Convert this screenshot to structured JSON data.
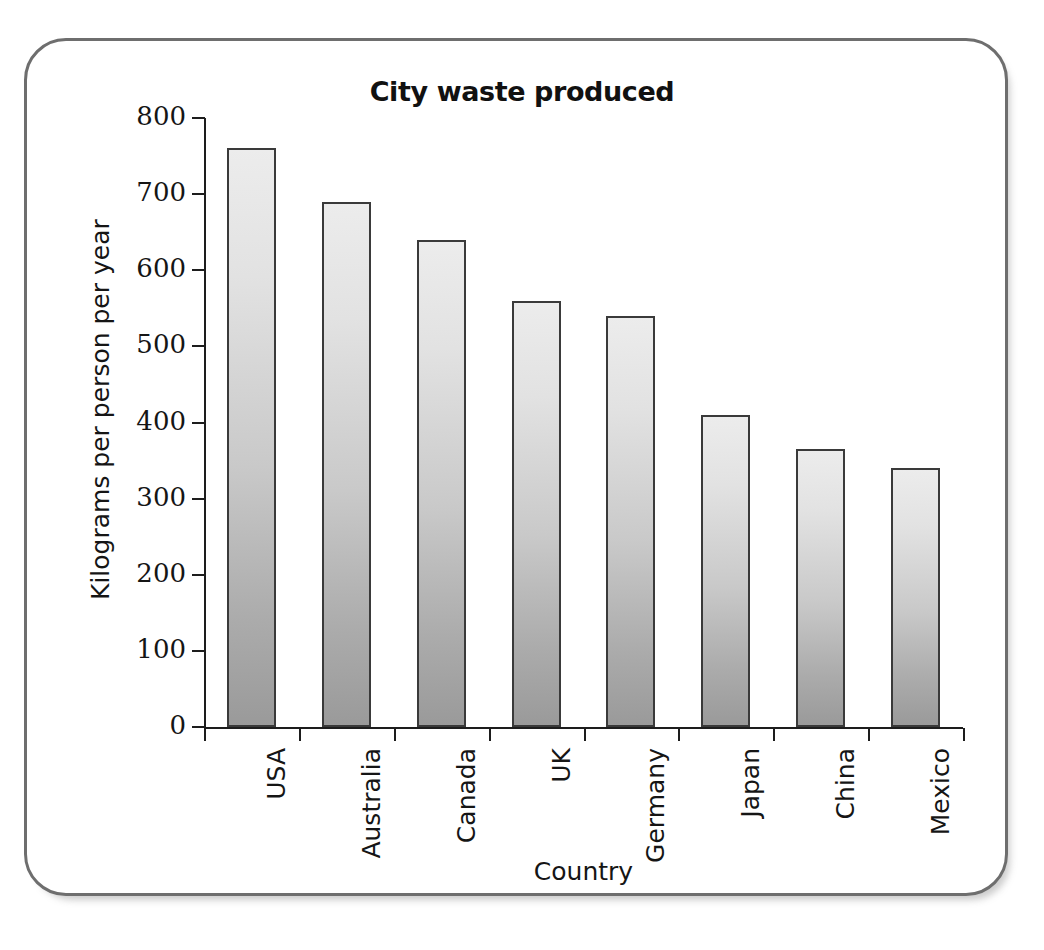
{
  "chart_data": {
    "type": "bar",
    "title": "City waste produced",
    "xlabel": "Country",
    "ylabel": "Kilograms per person per year",
    "categories": [
      "USA",
      "Australia",
      "Canada",
      "UK",
      "Germany",
      "Japan",
      "China",
      "Mexico"
    ],
    "values": [
      760,
      690,
      640,
      560,
      540,
      410,
      365,
      340
    ],
    "ylim": [
      0,
      800
    ],
    "ytick_labels": [
      "0",
      "100",
      "200",
      "300",
      "400",
      "500",
      "600",
      "700",
      "800"
    ],
    "ytick_values": [
      0,
      100,
      200,
      300,
      400,
      500,
      600,
      700,
      800
    ],
    "grid": false,
    "legend": "none",
    "bar_fill_top_color": "#ececec",
    "bar_fill_bottom_color": "#9a9a9a",
    "bar_border_color": "#3a3a3a",
    "axis_color": "#1d1d1d",
    "frame_border_color": "#6e6e6e",
    "background_color": "#ffffff"
  }
}
